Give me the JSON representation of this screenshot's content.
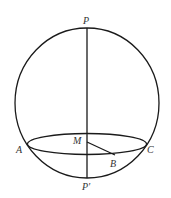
{
  "diagram": {
    "stroke_color": "#1a1a1a",
    "label_color": "#333333",
    "labels": {
      "P": "P",
      "P_prime": "P′",
      "M": "M",
      "A": "A",
      "B": "B",
      "C": "C"
    },
    "elements": [
      {
        "type": "sphere-outline",
        "cx": 87,
        "cy": 103,
        "rx": 72,
        "ry": 75
      },
      {
        "type": "axis",
        "from": "P",
        "to": "P′"
      },
      {
        "type": "circle-ellipse",
        "through": [
          "A",
          "B",
          "C"
        ],
        "center": "M"
      },
      {
        "type": "radius",
        "from": "M",
        "to": "B"
      }
    ]
  }
}
